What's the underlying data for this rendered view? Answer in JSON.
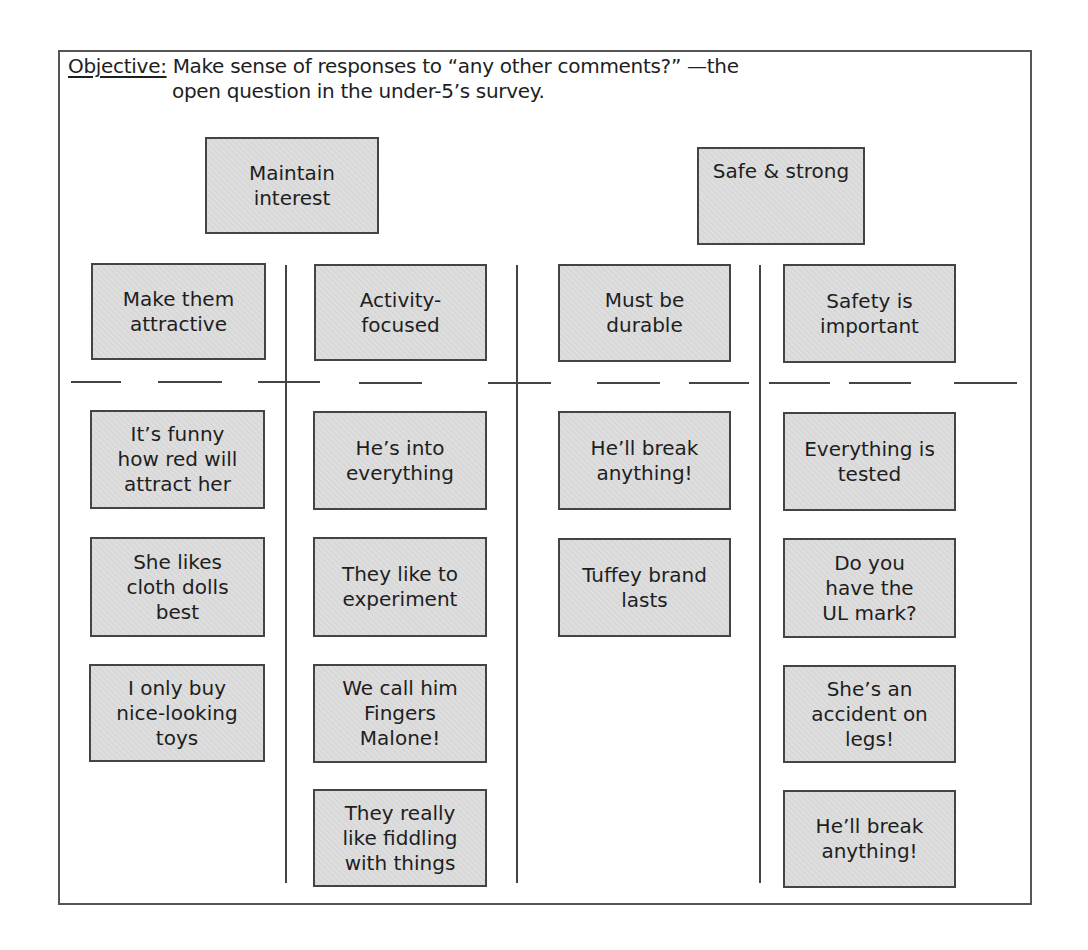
{
  "objective": {
    "label": "Objective:",
    "line1": "Make sense of responses to “any other comments?” —the",
    "line2": "open question in the under-5’s survey."
  },
  "groups": [
    {
      "title": "Maintain interest"
    },
    {
      "title": "Safe & strong"
    }
  ],
  "columns": [
    {
      "header": "Make them attractive",
      "cards": [
        "It’s funny how red will attract her",
        "She likes cloth dolls best",
        "I only buy nice-looking toys"
      ]
    },
    {
      "header": "Activity-focused",
      "cards": [
        "He’s into everything",
        "They like to experiment",
        "We call him Fingers Malone!",
        "They really like fiddling with things"
      ]
    },
    {
      "header": "Must be durable",
      "cards": [
        "He’ll break anything!",
        "Tuffey brand lasts"
      ]
    },
    {
      "header": "Safety is important",
      "cards": [
        "Everything is tested",
        "Do you have the UL mark?",
        "She’s an accident on legs!",
        "He’ll break anything!"
      ]
    }
  ],
  "colors": {
    "card_fill": "#dcdcdc",
    "card_border": "#444444",
    "frame_border": "#555555"
  }
}
